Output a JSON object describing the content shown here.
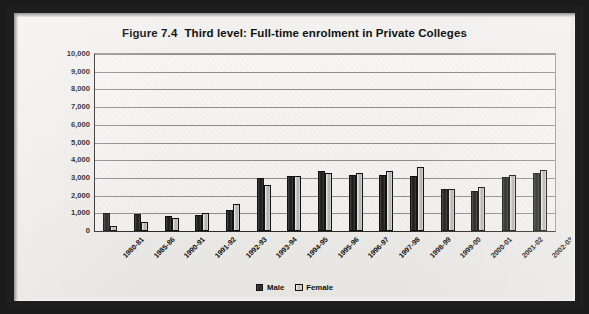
{
  "chart_data": {
    "type": "bar",
    "title_figure": "Figure 7.4",
    "title_text": "Third level: Full-time enrolment in Private Colleges",
    "xlabel": "",
    "ylabel": "",
    "ylim": [
      0,
      10000
    ],
    "ytick_step": 1000,
    "grid": true,
    "legend_position": "bottom-center",
    "categories": [
      "1980-81",
      "1985-86",
      "1990-91",
      "1991-92",
      "1992-93",
      "1993-94",
      "1994-95",
      "1995-96",
      "1996-97",
      "1997-98",
      "1998-99",
      "1999-00",
      "2000-01",
      "2001-02",
      "2002-03"
    ],
    "ytick_labels": [
      "10,000",
      "9,000",
      "8,000",
      "7,000",
      "6,000",
      "5,000",
      "4,000",
      "3,000",
      "2,000",
      "1,000",
      "0"
    ],
    "ytick_values": [
      10000,
      9000,
      8000,
      7000,
      6000,
      5000,
      4000,
      3000,
      2000,
      1000,
      0
    ],
    "series": [
      {
        "name": "Male",
        "color": "#262626",
        "values": [
          1000,
          950,
          850,
          900,
          1200,
          3000,
          3100,
          3400,
          3150,
          3150,
          3100,
          2400,
          2250,
          3050,
          3300
        ]
      },
      {
        "name": "Female",
        "color": "#c8c8c8",
        "values": [
          300,
          500,
          750,
          1000,
          1500,
          2600,
          3100,
          3250,
          3250,
          3400,
          3600,
          2350,
          2500,
          3150,
          3450
        ]
      }
    ]
  },
  "legend": {
    "items": [
      {
        "label": "Male"
      },
      {
        "label": "Female"
      }
    ]
  }
}
